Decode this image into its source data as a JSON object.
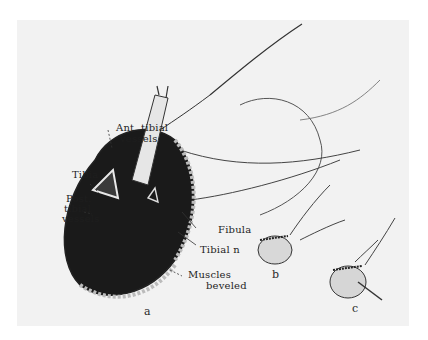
{
  "figure": {
    "labels": {
      "ant_tibial_vessels_1": "Ant. tibial",
      "ant_tibial_vessels_2": "vessels",
      "tibia": "Tibia",
      "post_tibial_vessels_1": "Post.",
      "post_tibial_vessels_2": "tibial",
      "post_tibial_vessels_3": "vessels",
      "fibula": "Fibula",
      "tibial_n": "Tibial n",
      "muscles_beveled_1": "Muscles",
      "muscles_beveled_2": "beveled"
    },
    "panels": {
      "a": "a",
      "b": "b",
      "c": "c"
    },
    "colors": {
      "background": "#f2f2f2",
      "ink": "#1e1e1e"
    }
  }
}
